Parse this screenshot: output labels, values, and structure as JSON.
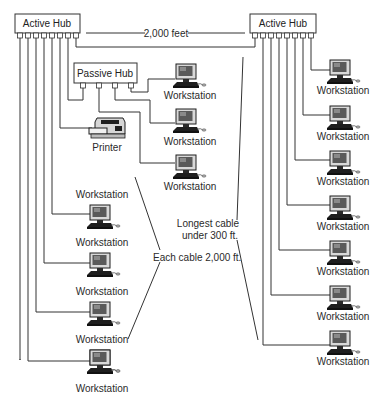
{
  "diagram": {
    "left_hub": {
      "label": "Active Hub",
      "ports": 8
    },
    "right_hub": {
      "label": "Active Hub",
      "ports": 8
    },
    "passive_hub": {
      "label": "Passive Hub",
      "ports": 4
    },
    "printer": {
      "label": "Printer"
    },
    "hub_distance_label": "2,000 feet",
    "annotation_each_cable": "Each cable 2,000 ft.",
    "annotation_longest_line1": "Longest cable",
    "annotation_longest_line2": "under 300 ft.",
    "passive_hub_workstations": [
      {
        "label": "Workstation"
      },
      {
        "label": "Workstation"
      },
      {
        "label": "Workstation"
      }
    ],
    "left_workstations": [
      {
        "label": "Workstation"
      },
      {
        "label": "Workstation"
      },
      {
        "label": "Workstation"
      },
      {
        "label": "Workstation"
      },
      {
        "label": "Workstation"
      }
    ],
    "right_workstations": [
      {
        "label": "Workstation"
      },
      {
        "label": "Workstation"
      },
      {
        "label": "Workstation"
      },
      {
        "label": "Workstation"
      },
      {
        "label": "Workstation"
      },
      {
        "label": "Workstation"
      },
      {
        "label": "Workstation"
      }
    ],
    "colors": {
      "line": "#333333",
      "monitor_screen": "#6e6e6e",
      "device_dark": "#1e1e1e",
      "box_fill": "#ffffff"
    }
  }
}
